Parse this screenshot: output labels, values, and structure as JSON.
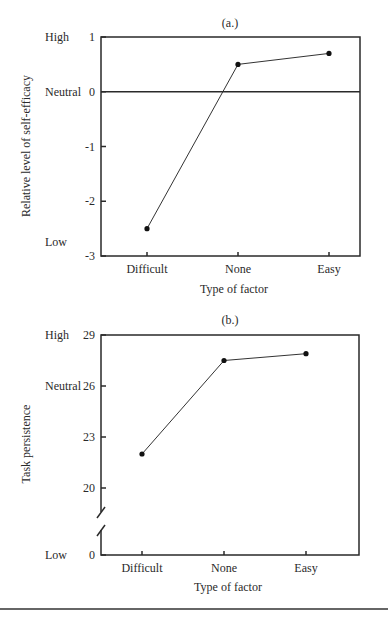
{
  "chart_data": [
    {
      "type": "line",
      "title": "(a.)",
      "xlabel": "Type of factor",
      "ylabel": "Relative level of self-efficacy",
      "categories": [
        "Difficult",
        "None",
        "Easy"
      ],
      "series": [
        {
          "name": "self-efficacy",
          "values": [
            -2.5,
            0.5,
            0.7
          ]
        }
      ],
      "ylim": [
        -3,
        1
      ],
      "yticks": [
        1,
        0,
        -1,
        -2,
        -3
      ],
      "ytick_labels": [
        "1",
        "0",
        "-1",
        "-2",
        "-3"
      ],
      "reference_line": 0,
      "qualitative_labels": [
        {
          "label": "High",
          "at": 1
        },
        {
          "label": "Neutral",
          "at": 0
        },
        {
          "label": "Low",
          "at": -2.75
        }
      ],
      "grid": false,
      "axis_break": false
    },
    {
      "type": "line",
      "title": "(b.)",
      "xlabel": "Type of factor",
      "ylabel": "Task persistence",
      "categories": [
        "Difficult",
        "None",
        "Easy"
      ],
      "series": [
        {
          "name": "task persistence",
          "values": [
            22.0,
            27.5,
            27.9
          ]
        }
      ],
      "ylim": [
        0,
        29
      ],
      "yticks": [
        29,
        26,
        23,
        20,
        0
      ],
      "ytick_labels": [
        "29",
        "26",
        "23",
        "20",
        "0"
      ],
      "qualitative_labels": [
        {
          "label": "High",
          "at": 29
        },
        {
          "label": "Neutral",
          "at": 26
        },
        {
          "label": "Low",
          "at": 0
        }
      ],
      "grid": false,
      "axis_break": true
    }
  ]
}
